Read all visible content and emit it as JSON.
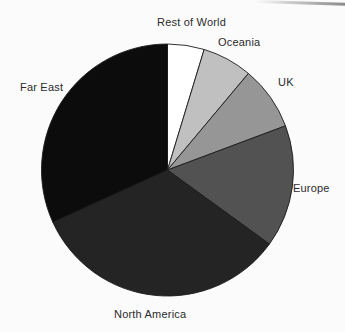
{
  "page": {
    "background": "#fbfbfb"
  },
  "chart_data": {
    "type": "pie",
    "title": "",
    "legend": "none",
    "labels_position": "outside",
    "direction": "clockwise",
    "start_angle_deg": 0,
    "center_px": [
      167.5,
      170
    ],
    "radius_px": 126,
    "slice_stroke": "#1c1c1c",
    "values_note": "percent of total, estimated from slice angles",
    "slices": [
      {
        "label": "Rest of World",
        "value": 4.7,
        "color": "#ffffff"
      },
      {
        "label": "Oceania",
        "value": 6.4,
        "color": "#c0c0c0"
      },
      {
        "label": "UK",
        "value": 8.2,
        "color": "#969696"
      },
      {
        "label": "Europe",
        "value": 15.7,
        "color": "#525252"
      },
      {
        "label": "North America",
        "value": 33.2,
        "color": "#242424"
      },
      {
        "label": "Far East",
        "value": 31.8,
        "color": "#0c0c0c"
      }
    ]
  },
  "artifacts": {
    "scan_streak_color": "#8a8a8a"
  }
}
